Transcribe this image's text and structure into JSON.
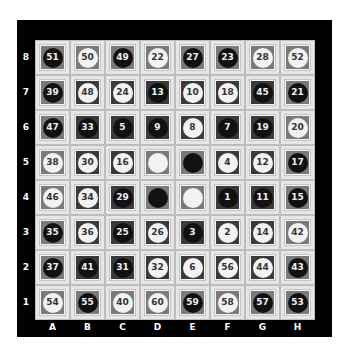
{
  "board": {
    "files": [
      "A",
      "B",
      "C",
      "D",
      "E",
      "F",
      "G",
      "H"
    ],
    "ranks": [
      "8",
      "7",
      "6",
      "5",
      "4",
      "3",
      "2",
      "1"
    ],
    "colors": {
      "frame": "#000000",
      "cell_bg": "#e6e6e6",
      "inner_medium": "#7a7a7a",
      "inner_dark": "#3a3a3a",
      "piece_black": "#111111",
      "piece_white": "#f2f2f2"
    },
    "rows": [
      [
        {
          "square": "A8",
          "inner": "medium",
          "piece": "black",
          "label": "51"
        },
        {
          "square": "B8",
          "inner": "medium",
          "piece": "white",
          "label": "50"
        },
        {
          "square": "C8",
          "inner": "medium",
          "piece": "black",
          "label": "49"
        },
        {
          "square": "D8",
          "inner": "medium",
          "piece": "white",
          "label": "22"
        },
        {
          "square": "E8",
          "inner": "medium",
          "piece": "black",
          "label": "27"
        },
        {
          "square": "F8",
          "inner": "medium",
          "piece": "black",
          "label": "23"
        },
        {
          "square": "G8",
          "inner": "medium",
          "piece": "white",
          "label": "28"
        },
        {
          "square": "H8",
          "inner": "medium",
          "piece": "white",
          "label": "52"
        }
      ],
      [
        {
          "square": "A7",
          "inner": "medium",
          "piece": "black",
          "label": "39"
        },
        {
          "square": "B7",
          "inner": "dark",
          "piece": "white",
          "label": "48"
        },
        {
          "square": "C7",
          "inner": "dark",
          "piece": "white",
          "label": "24"
        },
        {
          "square": "D7",
          "inner": "dark",
          "piece": "black",
          "label": "13"
        },
        {
          "square": "E7",
          "inner": "dark",
          "piece": "white",
          "label": "10"
        },
        {
          "square": "F7",
          "inner": "dark",
          "piece": "white",
          "label": "18"
        },
        {
          "square": "G7",
          "inner": "dark",
          "piece": "black",
          "label": "45"
        },
        {
          "square": "H7",
          "inner": "medium",
          "piece": "black",
          "label": "21"
        }
      ],
      [
        {
          "square": "A6",
          "inner": "medium",
          "piece": "black",
          "label": "47"
        },
        {
          "square": "B6",
          "inner": "dark",
          "piece": "black",
          "label": "33"
        },
        {
          "square": "C6",
          "inner": "dark",
          "piece": "black",
          "label": "5"
        },
        {
          "square": "D6",
          "inner": "dark",
          "piece": "black",
          "label": "9"
        },
        {
          "square": "E6",
          "inner": "dark",
          "piece": "white",
          "label": "8"
        },
        {
          "square": "F6",
          "inner": "dark",
          "piece": "black",
          "label": "7"
        },
        {
          "square": "G6",
          "inner": "dark",
          "piece": "black",
          "label": "19"
        },
        {
          "square": "H6",
          "inner": "medium",
          "piece": "white",
          "label": "20"
        }
      ],
      [
        {
          "square": "A5",
          "inner": "medium",
          "piece": "white",
          "label": "38"
        },
        {
          "square": "B5",
          "inner": "dark",
          "piece": "white",
          "label": "30"
        },
        {
          "square": "C5",
          "inner": "dark",
          "piece": "white",
          "label": "16"
        },
        {
          "square": "D5",
          "inner": "medium",
          "piece": "white",
          "label": ""
        },
        {
          "square": "E5",
          "inner": "medium",
          "piece": "black",
          "label": ""
        },
        {
          "square": "F5",
          "inner": "dark",
          "piece": "white",
          "label": "4"
        },
        {
          "square": "G5",
          "inner": "dark",
          "piece": "white",
          "label": "12"
        },
        {
          "square": "H5",
          "inner": "medium",
          "piece": "black",
          "label": "17"
        }
      ],
      [
        {
          "square": "A4",
          "inner": "medium",
          "piece": "white",
          "label": "46"
        },
        {
          "square": "B4",
          "inner": "dark",
          "piece": "white",
          "label": "34"
        },
        {
          "square": "C4",
          "inner": "dark",
          "piece": "black",
          "label": "29"
        },
        {
          "square": "D4",
          "inner": "medium",
          "piece": "black",
          "label": ""
        },
        {
          "square": "E4",
          "inner": "medium",
          "piece": "white",
          "label": ""
        },
        {
          "square": "F4",
          "inner": "dark",
          "piece": "black",
          "label": "1"
        },
        {
          "square": "G4",
          "inner": "dark",
          "piece": "black",
          "label": "11"
        },
        {
          "square": "H4",
          "inner": "medium",
          "piece": "black",
          "label": "15"
        }
      ],
      [
        {
          "square": "A3",
          "inner": "medium",
          "piece": "black",
          "label": "35"
        },
        {
          "square": "B3",
          "inner": "dark",
          "piece": "white",
          "label": "36"
        },
        {
          "square": "C3",
          "inner": "dark",
          "piece": "black",
          "label": "25"
        },
        {
          "square": "D3",
          "inner": "dark",
          "piece": "white",
          "label": "26"
        },
        {
          "square": "E3",
          "inner": "dark",
          "piece": "black",
          "label": "3"
        },
        {
          "square": "F3",
          "inner": "dark",
          "piece": "white",
          "label": "2"
        },
        {
          "square": "G3",
          "inner": "dark",
          "piece": "white",
          "label": "14"
        },
        {
          "square": "H3",
          "inner": "medium",
          "piece": "white",
          "label": "42"
        }
      ],
      [
        {
          "square": "A2",
          "inner": "medium",
          "piece": "black",
          "label": "37"
        },
        {
          "square": "B2",
          "inner": "dark",
          "piece": "black",
          "label": "41"
        },
        {
          "square": "C2",
          "inner": "dark",
          "piece": "black",
          "label": "31"
        },
        {
          "square": "D2",
          "inner": "dark",
          "piece": "white",
          "label": "32"
        },
        {
          "square": "E2",
          "inner": "dark",
          "piece": "white",
          "label": "6"
        },
        {
          "square": "F2",
          "inner": "dark",
          "piece": "white",
          "label": "56"
        },
        {
          "square": "G2",
          "inner": "dark",
          "piece": "white",
          "label": "44"
        },
        {
          "square": "H2",
          "inner": "medium",
          "piece": "black",
          "label": "43"
        }
      ],
      [
        {
          "square": "A1",
          "inner": "medium",
          "piece": "white",
          "label": "54"
        },
        {
          "square": "B1",
          "inner": "medium",
          "piece": "black",
          "label": "55"
        },
        {
          "square": "C1",
          "inner": "medium",
          "piece": "white",
          "label": "40"
        },
        {
          "square": "D1",
          "inner": "medium",
          "piece": "white",
          "label": "60"
        },
        {
          "square": "E1",
          "inner": "medium",
          "piece": "black",
          "label": "59"
        },
        {
          "square": "F1",
          "inner": "medium",
          "piece": "white",
          "label": "58"
        },
        {
          "square": "G1",
          "inner": "medium",
          "piece": "black",
          "label": "57"
        },
        {
          "square": "H1",
          "inner": "medium",
          "piece": "black",
          "label": "53"
        }
      ]
    ]
  }
}
